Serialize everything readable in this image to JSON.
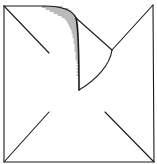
{
  "diagram": {
    "title": "Square with corner fold",
    "stroke_color": "#1a1a1a",
    "background": "#ffffff",
    "parts": [
      {
        "id": "outline",
        "label": "square outline"
      },
      {
        "id": "diag-tl",
        "label": "top-left diagonal"
      },
      {
        "id": "diag-tr",
        "label": "top-right diagonal"
      },
      {
        "id": "diag-bl",
        "label": "bottom-left diagonal"
      },
      {
        "id": "diag-br",
        "label": "bottom-right diagonal"
      },
      {
        "id": "fold-flap",
        "label": "folded flap with hatching"
      }
    ]
  }
}
